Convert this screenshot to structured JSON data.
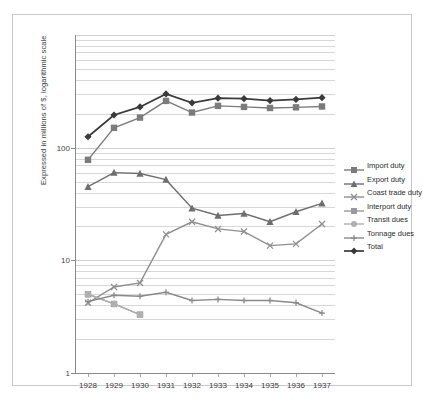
{
  "chart_data": {
    "type": "line",
    "title": "",
    "xlabel": "",
    "ylabel": "Expressed  in millions of $, logarithmic scale",
    "yscale": "log",
    "ylim": [
      1,
      1000
    ],
    "ytick_labels": [
      "1",
      "10",
      "100"
    ],
    "ytick_values": [
      1,
      10,
      100
    ],
    "grid": true,
    "legend_position": "right",
    "categories": [
      "1928",
      "1929",
      "1930",
      "1931",
      "1932",
      "1933",
      "1934",
      "1935",
      "1936",
      "1937"
    ],
    "series": [
      {
        "name": "Import duty",
        "marker": "square",
        "color": "#7b7b7b",
        "values": [
          78,
          150,
          185,
          260,
          205,
          235,
          230,
          225,
          228,
          232
        ]
      },
      {
        "name": "Export duty",
        "marker": "triangle",
        "color": "#6e6e6e",
        "values": [
          45,
          60,
          59,
          52,
          29,
          25,
          26,
          22,
          27,
          32
        ]
      },
      {
        "name": "Coast trade duty",
        "marker": "x",
        "color": "#8f8f8f",
        "values": [
          4.2,
          5.8,
          6.3,
          17,
          22,
          19,
          18,
          13.5,
          14,
          21
        ]
      },
      {
        "name": "Interport duty",
        "marker": "square",
        "color": "#9a9a9a",
        "values": [
          5.0,
          4.1,
          3.3,
          null,
          null,
          null,
          null,
          null,
          null,
          null
        ]
      },
      {
        "name": "Transit dues",
        "marker": "circle",
        "color": "#b0b0b0",
        "values": [
          5.0,
          4.1,
          3.3,
          null,
          null,
          null,
          null,
          null,
          null,
          null
        ]
      },
      {
        "name": "Tonnage dues",
        "marker": "plus",
        "color": "#8a8a8a",
        "values": [
          4.3,
          4.9,
          4.8,
          5.2,
          4.4,
          4.5,
          4.4,
          4.4,
          4.2,
          3.4
        ]
      },
      {
        "name": "Total",
        "marker": "diamond",
        "color": "#3a3a3a",
        "values": [
          125,
          195,
          230,
          300,
          250,
          275,
          272,
          262,
          268,
          278
        ]
      }
    ]
  },
  "legend": {
    "items": [
      {
        "label": "Import duty"
      },
      {
        "label": "Export duty"
      },
      {
        "label": "Coast trade duty"
      },
      {
        "label": "Interport duty"
      },
      {
        "label": "Transit dues"
      },
      {
        "label": "Tonnage dues"
      },
      {
        "label": "Total"
      }
    ]
  }
}
